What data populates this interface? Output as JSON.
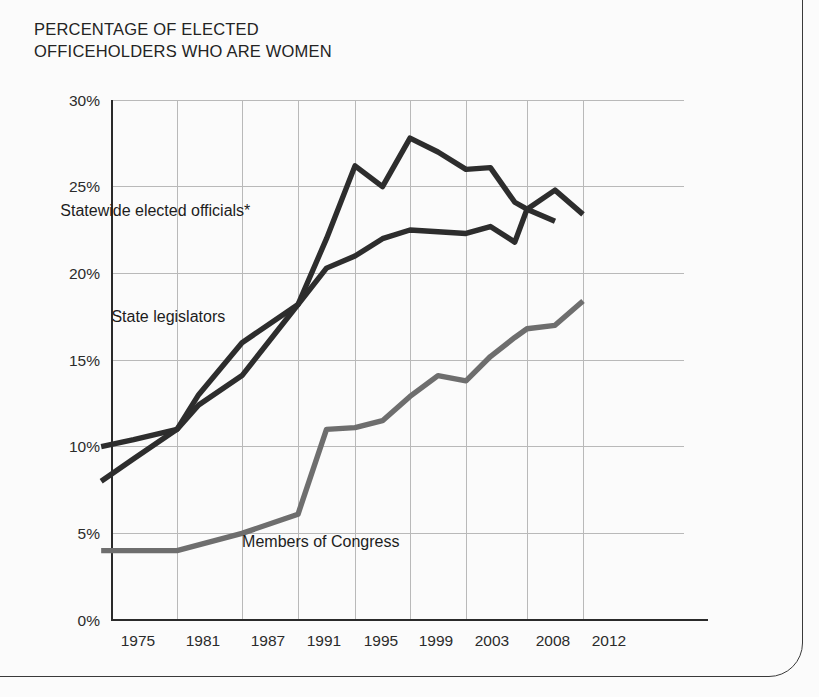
{
  "title": "PERCENTAGE OF ELECTED\nOFFICEHOLDERS WHO ARE WOMEN",
  "colors": {
    "dark_series": "#2d2d2d",
    "congress_series": "#6e6e6e",
    "gridline": "#b9b9b9",
    "axis": "#2a2a2a",
    "paper": "#fbfbfb"
  },
  "chart_data": {
    "type": "line",
    "title": "PERCENTAGE OF ELECTED OFFICEHOLDERS WHO ARE WOMEN",
    "xlabel": "",
    "ylabel": "",
    "xlim": [
      1974,
      2013
    ],
    "ylim": [
      0,
      30
    ],
    "grid": true,
    "legend_position": "inline-annotations",
    "x_tick_labels": [
      "1975",
      "1981",
      "1987",
      "1991",
      "1995",
      "1999",
      "2003",
      "2008",
      "2012"
    ],
    "x_tick_values": [
      1975,
      1981,
      1987,
      1991,
      1995,
      1999,
      2003,
      2008,
      2012
    ],
    "y_tick_labels": [
      "0%",
      "5%",
      "10%",
      "15%",
      "20%",
      "25%",
      "30%"
    ],
    "y_tick_values": [
      0,
      5,
      10,
      15,
      20,
      25,
      30
    ],
    "series": [
      {
        "name": "Statewide elected officials*",
        "color": "#2d2d2d",
        "label_x": 1979.0,
        "label_y": 23.3,
        "x": [
          1974,
          1977,
          1981,
          1983,
          1987,
          1991,
          1993,
          1995,
          1997,
          1999,
          2001,
          2003,
          2005,
          2007,
          2008,
          2010
        ],
        "y": [
          10.0,
          10.4,
          11.0,
          13.0,
          16.0,
          18.2,
          22.0,
          26.2,
          25.0,
          27.8,
          27.0,
          26.0,
          26.1,
          24.1,
          23.7,
          23.0
        ]
      },
      {
        "name": "State legislators",
        "color": "#2d2d2d",
        "label_x": 1980.2,
        "label_y": 17.2,
        "x": [
          1974,
          1977,
          1981,
          1983,
          1987,
          1991,
          1993,
          1995,
          1997,
          1999,
          2001,
          2003,
          2005,
          2007,
          2008,
          2010,
          2012
        ],
        "y": [
          8.0,
          9.3,
          11.0,
          12.4,
          14.1,
          18.2,
          20.3,
          21.0,
          22.0,
          22.5,
          22.4,
          22.3,
          22.7,
          21.8,
          23.7,
          24.8,
          23.4
        ]
      },
      {
        "name": "Members of Congress",
        "color": "#6e6e6e",
        "label_x": 1992.6,
        "label_y": 4.2,
        "x": [
          1974,
          1981,
          1987,
          1991,
          1993,
          1995,
          1997,
          1999,
          2001,
          2003,
          2005,
          2007,
          2008,
          2010,
          2012
        ],
        "y": [
          4.0,
          4.0,
          5.0,
          6.1,
          11.0,
          11.1,
          11.5,
          12.9,
          14.1,
          13.8,
          15.2,
          16.3,
          16.8,
          17.0,
          18.4
        ]
      }
    ],
    "footnote_marker": "*"
  }
}
